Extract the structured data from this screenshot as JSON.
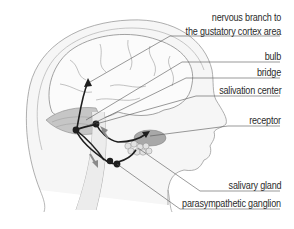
{
  "diagram": {
    "labels": [
      {
        "id": "nervous-branch",
        "line1": "nervous branch to",
        "line2": "the gustatory cortex area"
      },
      {
        "id": "bulb",
        "text": "bulb"
      },
      {
        "id": "bridge",
        "text": "bridge"
      },
      {
        "id": "salivation-center",
        "text": "salivation center"
      },
      {
        "id": "receptor",
        "text": "receptor"
      },
      {
        "id": "salivary-gland",
        "text": "salivary gland"
      },
      {
        "id": "parasympathetic-ganglion",
        "text": "parasympathetic ganglion"
      }
    ],
    "colors": {
      "outline": "#9a9a9a",
      "nerve": "#1e1e1e",
      "leader": "#555555",
      "shade": "#bdbdbd",
      "arrow_gray": "#8a8a8a",
      "text": "#2b2b2b"
    }
  }
}
